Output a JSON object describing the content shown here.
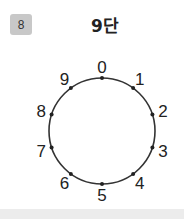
{
  "badge": {
    "number": "8",
    "color": "#c8c8c8"
  },
  "title": "9단",
  "chart_data": {
    "type": "diagram",
    "title": "9단",
    "points": [
      {
        "label": "0",
        "angle_deg": 0
      },
      {
        "label": "1",
        "angle_deg": 36
      },
      {
        "label": "2",
        "angle_deg": 72
      },
      {
        "label": "3",
        "angle_deg": 108
      },
      {
        "label": "4",
        "angle_deg": 144
      },
      {
        "label": "5",
        "angle_deg": 180
      },
      {
        "label": "6",
        "angle_deg": 216
      },
      {
        "label": "7",
        "angle_deg": 252
      },
      {
        "label": "8",
        "angle_deg": 288
      },
      {
        "label": "9",
        "angle_deg": 324
      }
    ],
    "circle": {
      "cx": 102,
      "cy": 131,
      "r": 53,
      "stroke": "#333333"
    }
  }
}
